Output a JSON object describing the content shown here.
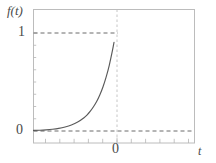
{
  "figure": {
    "width": 216,
    "height": 163,
    "background_color": "#ffffff",
    "frame_color": "#b9b9b9",
    "curve_color": "#555555",
    "dash_color": "#6e6e6e",
    "tick_color": "#b0b0b0",
    "text_color": "#4a4a4a"
  },
  "labels": {
    "y_axis": "f(t)",
    "x_axis": "t",
    "y_tick_one": "1",
    "y_tick_zero": "0",
    "x_tick_zero": "0"
  },
  "chart_data": {
    "type": "line",
    "title": "",
    "xlabel": "t",
    "ylabel": "f(t)",
    "xlim": [
      -5.2,
      5.0
    ],
    "ylim": [
      -0.08,
      1.12
    ],
    "grid": false,
    "legend": null,
    "function": "exp(-|t|)",
    "x_ticks": [
      -5.2,
      -4.2,
      -3.2,
      -2.2,
      -1.2,
      0,
      1.0,
      2.0,
      3.0,
      4.0,
      5.0
    ],
    "x_tick_labels": [
      "",
      "",
      "",
      "",
      "",
      "0",
      "",
      "",
      "",
      "",
      ""
    ],
    "y_ticks": [
      0,
      0.125,
      0.25,
      0.375,
      0.5,
      0.625,
      0.75,
      0.875,
      1
    ],
    "y_tick_labels": [
      "0",
      "",
      "",
      "",
      "",
      "",
      "",
      "",
      "1"
    ],
    "annotations": [
      {
        "kind": "hline",
        "y": 1,
        "style": "dashed",
        "label": "y = 1 reference"
      },
      {
        "kind": "hline",
        "y": 0,
        "style": "dashed",
        "label": "y = 0 asymptote"
      },
      {
        "kind": "vline",
        "x": 0,
        "style": "dashed",
        "label": "t = 0 axis"
      }
    ],
    "series": [
      {
        "name": "f(t) = exp(-|t|)",
        "x": [
          -5.2,
          -4.8,
          -4.4,
          -4.0,
          -3.6,
          -3.2,
          -2.8,
          -2.4,
          -2.0,
          -1.8,
          -1.6,
          -1.4,
          -1.2,
          -1.0,
          -0.8,
          -0.6,
          -0.4,
          -0.2,
          -0.1,
          0.0,
          0.1,
          0.2,
          0.4,
          0.6,
          0.8,
          1.0,
          1.2,
          1.4,
          1.6,
          1.8,
          2.0,
          2.4,
          2.8,
          3.2,
          3.6,
          4.0,
          4.4,
          4.8,
          5.0
        ],
        "y": [
          0.006,
          0.008,
          0.012,
          0.018,
          0.027,
          0.041,
          0.061,
          0.091,
          0.135,
          0.165,
          0.202,
          0.247,
          0.301,
          0.368,
          0.449,
          0.549,
          0.67,
          0.819,
          0.905,
          1.0,
          0.905,
          0.819,
          0.67,
          0.549,
          0.449,
          0.368,
          0.301,
          0.247,
          0.202,
          0.165,
          0.135,
          0.091,
          0.061,
          0.041,
          0.027,
          0.018,
          0.012,
          0.008,
          0.007
        ]
      }
    ]
  }
}
